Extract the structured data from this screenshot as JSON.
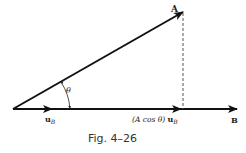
{
  "figure": {
    "caption": "Fig. 4–26",
    "vector_a_label": "A",
    "vector_b_label": "B",
    "angle_label": "θ",
    "unit_vector_label": "u",
    "unit_vector_subscript": "B",
    "projection_label_prefix": "(A cos θ) ",
    "projection_label_vector": "u",
    "projection_label_subscript": "B"
  }
}
